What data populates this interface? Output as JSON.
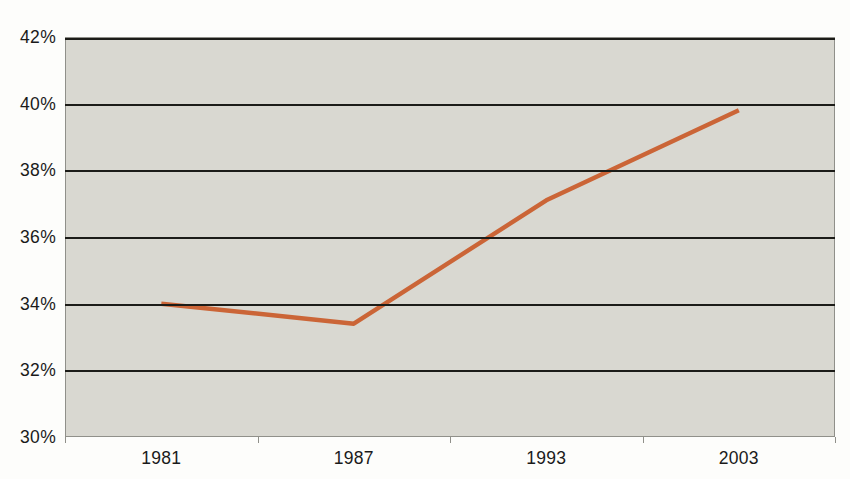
{
  "chart_data": {
    "type": "line",
    "title": "",
    "xlabel": "",
    "ylabel": "",
    "categories": [
      "1981",
      "1987",
      "1993",
      "2003"
    ],
    "series": [
      {
        "name": "percentage",
        "values": [
          34.0,
          33.4,
          37.1,
          39.8
        ]
      }
    ],
    "ylim": [
      30,
      42
    ],
    "y_ticks": [
      {
        "value": 42,
        "label": "42%"
      },
      {
        "value": 40,
        "label": "40%"
      },
      {
        "value": 38,
        "label": "38%"
      },
      {
        "value": 36,
        "label": "36%"
      },
      {
        "value": 34,
        "label": "34%"
      },
      {
        "value": 32,
        "label": "32%"
      },
      {
        "value": 30,
        "label": "30%"
      }
    ],
    "grid": "horizontal",
    "gridline_values": [
      42,
      40,
      38,
      36,
      34,
      32
    ],
    "legend": "none",
    "colors": {
      "line": "#cb6537",
      "plot_background": "#d9d8d1",
      "gridline": "#1c1c18",
      "axis_border": "#90908a",
      "tick_text": "#1a1a1a",
      "page_background": "#fdfdfb"
    }
  }
}
